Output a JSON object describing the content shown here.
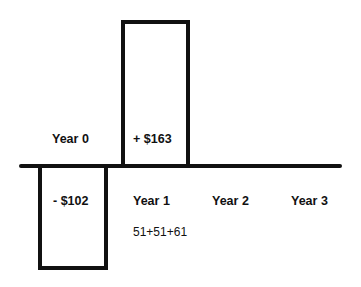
{
  "diagram": {
    "type": "cash-flow-diagram",
    "axis_color": "#111111",
    "periods": [
      {
        "label": "Year 0"
      },
      {
        "label": "Year 1"
      },
      {
        "label": "Year 2"
      },
      {
        "label": "Year 3"
      }
    ],
    "flows": [
      {
        "label": "- $102",
        "direction": "down",
        "value": -102
      },
      {
        "label": "+ $163",
        "direction": "up",
        "value": 163
      }
    ],
    "annotation": "51+51+61"
  }
}
